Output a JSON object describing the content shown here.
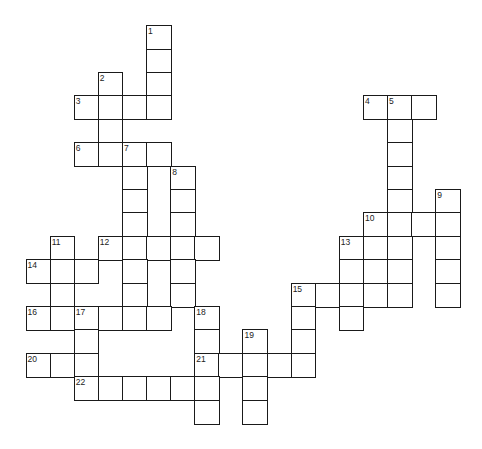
{
  "puzzle": {
    "grid": {
      "origin_x": 26.3,
      "origin_y": 26,
      "col_width": 24.1,
      "row_height": 23.4,
      "line_color": "#1a1a1a",
      "cell_fill": "#ffffff"
    },
    "cells": [
      {
        "r": 0,
        "c": 5,
        "n": "1"
      },
      {
        "r": 1,
        "c": 5
      },
      {
        "r": 2,
        "c": 3,
        "n": "2"
      },
      {
        "r": 2,
        "c": 5
      },
      {
        "r": 3,
        "c": 2,
        "n": "3"
      },
      {
        "r": 3,
        "c": 3
      },
      {
        "r": 3,
        "c": 4
      },
      {
        "r": 3,
        "c": 5
      },
      {
        "r": 3,
        "c": 14,
        "n": "4"
      },
      {
        "r": 3,
        "c": 15,
        "n": "5"
      },
      {
        "r": 3,
        "c": 16
      },
      {
        "r": 4,
        "c": 3
      },
      {
        "r": 4,
        "c": 15
      },
      {
        "r": 5,
        "c": 2,
        "n": "6"
      },
      {
        "r": 5,
        "c": 3
      },
      {
        "r": 5,
        "c": 4,
        "n": "7"
      },
      {
        "r": 5,
        "c": 5
      },
      {
        "r": 5,
        "c": 15
      },
      {
        "r": 6,
        "c": 4
      },
      {
        "r": 6,
        "c": 6,
        "n": "8"
      },
      {
        "r": 6,
        "c": 15
      },
      {
        "r": 7,
        "c": 4
      },
      {
        "r": 7,
        "c": 6
      },
      {
        "r": 7,
        "c": 15
      },
      {
        "r": 7,
        "c": 17,
        "n": "9"
      },
      {
        "r": 8,
        "c": 4
      },
      {
        "r": 8,
        "c": 6
      },
      {
        "r": 8,
        "c": 14,
        "n": "10"
      },
      {
        "r": 8,
        "c": 15
      },
      {
        "r": 8,
        "c": 16
      },
      {
        "r": 8,
        "c": 17
      },
      {
        "r": 9,
        "c": 1,
        "n": "11"
      },
      {
        "r": 9,
        "c": 3,
        "n": "12"
      },
      {
        "r": 9,
        "c": 4
      },
      {
        "r": 9,
        "c": 5
      },
      {
        "r": 9,
        "c": 6
      },
      {
        "r": 9,
        "c": 7
      },
      {
        "r": 9,
        "c": 13,
        "n": "13"
      },
      {
        "r": 9,
        "c": 14
      },
      {
        "r": 9,
        "c": 15
      },
      {
        "r": 9,
        "c": 17
      },
      {
        "r": 10,
        "c": 0,
        "n": "14"
      },
      {
        "r": 10,
        "c": 1
      },
      {
        "r": 10,
        "c": 2
      },
      {
        "r": 10,
        "c": 4
      },
      {
        "r": 10,
        "c": 6
      },
      {
        "r": 10,
        "c": 13
      },
      {
        "r": 10,
        "c": 14
      },
      {
        "r": 10,
        "c": 15
      },
      {
        "r": 10,
        "c": 17
      },
      {
        "r": 11,
        "c": 1
      },
      {
        "r": 11,
        "c": 4
      },
      {
        "r": 11,
        "c": 6
      },
      {
        "r": 11,
        "c": 11,
        "n": "15"
      },
      {
        "r": 11,
        "c": 12
      },
      {
        "r": 11,
        "c": 13
      },
      {
        "r": 11,
        "c": 14
      },
      {
        "r": 11,
        "c": 15
      },
      {
        "r": 11,
        "c": 17
      },
      {
        "r": 12,
        "c": 0,
        "n": "16"
      },
      {
        "r": 12,
        "c": 1
      },
      {
        "r": 12,
        "c": 2,
        "n": "17"
      },
      {
        "r": 12,
        "c": 3
      },
      {
        "r": 12,
        "c": 4
      },
      {
        "r": 12,
        "c": 5
      },
      {
        "r": 12,
        "c": 7,
        "n": "18"
      },
      {
        "r": 12,
        "c": 11
      },
      {
        "r": 12,
        "c": 13
      },
      {
        "r": 13,
        "c": 2
      },
      {
        "r": 13,
        "c": 7
      },
      {
        "r": 13,
        "c": 9,
        "n": "19"
      },
      {
        "r": 13,
        "c": 11
      },
      {
        "r": 14,
        "c": 0,
        "n": "20"
      },
      {
        "r": 14,
        "c": 1
      },
      {
        "r": 14,
        "c": 2
      },
      {
        "r": 14,
        "c": 7,
        "n": "21"
      },
      {
        "r": 14,
        "c": 8
      },
      {
        "r": 14,
        "c": 9
      },
      {
        "r": 14,
        "c": 10
      },
      {
        "r": 14,
        "c": 11
      },
      {
        "r": 15,
        "c": 2,
        "n": "22"
      },
      {
        "r": 15,
        "c": 3
      },
      {
        "r": 15,
        "c": 4
      },
      {
        "r": 15,
        "c": 5
      },
      {
        "r": 15,
        "c": 6
      },
      {
        "r": 15,
        "c": 7
      },
      {
        "r": 15,
        "c": 9
      },
      {
        "r": 16,
        "c": 7
      },
      {
        "r": 16,
        "c": 9
      }
    ],
    "entries": {
      "across": [
        {
          "number": "3",
          "row": 3,
          "col": 2,
          "length": 4
        },
        {
          "number": "4",
          "row": 3,
          "col": 14,
          "length": 3
        },
        {
          "number": "6",
          "row": 5,
          "col": 2,
          "length": 4
        },
        {
          "number": "10",
          "row": 8,
          "col": 14,
          "length": 4
        },
        {
          "number": "12",
          "row": 9,
          "col": 3,
          "length": 5
        },
        {
          "number": "14",
          "row": 10,
          "col": 0,
          "length": 3
        },
        {
          "number": "15",
          "row": 11,
          "col": 11,
          "length": 5
        },
        {
          "number": "16",
          "row": 12,
          "col": 0,
          "length": 6
        },
        {
          "number": "20",
          "row": 14,
          "col": 0,
          "length": 3
        },
        {
          "number": "21",
          "row": 14,
          "col": 7,
          "length": 5
        },
        {
          "number": "22",
          "row": 15,
          "col": 2,
          "length": 6
        }
      ],
      "down": [
        {
          "number": "1",
          "row": 0,
          "col": 5,
          "length": 4
        },
        {
          "number": "2",
          "row": 2,
          "col": 3,
          "length": 4
        },
        {
          "number": "5",
          "row": 3,
          "col": 15,
          "length": 9
        },
        {
          "number": "7",
          "row": 5,
          "col": 4,
          "length": 8
        },
        {
          "number": "8",
          "row": 6,
          "col": 6,
          "length": 6
        },
        {
          "number": "9",
          "row": 7,
          "col": 17,
          "length": 5
        },
        {
          "number": "10",
          "row": 8,
          "col": 14,
          "length": 4
        },
        {
          "number": "11",
          "row": 9,
          "col": 1,
          "length": 4
        },
        {
          "number": "13",
          "row": 9,
          "col": 13,
          "length": 4
        },
        {
          "number": "15",
          "row": 11,
          "col": 11,
          "length": 4
        },
        {
          "number": "17",
          "row": 12,
          "col": 2,
          "length": 4
        },
        {
          "number": "18",
          "row": 12,
          "col": 7,
          "length": 5
        },
        {
          "number": "19",
          "row": 13,
          "col": 9,
          "length": 4
        }
      ]
    }
  }
}
